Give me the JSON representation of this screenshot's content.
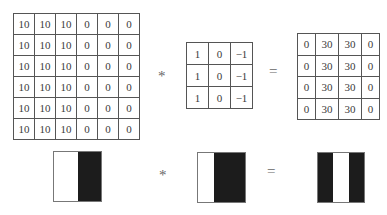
{
  "top_row": {
    "input_matrix": [
      [
        "10",
        "10",
        "10",
        "0",
        "0",
        "0"
      ],
      [
        "10",
        "10",
        "10",
        "0",
        "0",
        "0"
      ],
      [
        "10",
        "10",
        "10",
        "0",
        "0",
        "0"
      ],
      [
        "10",
        "10",
        "10",
        "0",
        "0",
        "0"
      ],
      [
        "10",
        "10",
        "10",
        "0",
        "0",
        "0"
      ],
      [
        "10",
        "10",
        "10",
        "0",
        "0",
        "0"
      ]
    ],
    "convolution_operator": "*",
    "kernel_matrix": [
      [
        "1",
        "0",
        "−1"
      ],
      [
        "1",
        "0",
        "−1"
      ],
      [
        "1",
        "0",
        "−1"
      ]
    ],
    "equals_operator": "=",
    "output_matrix": [
      [
        "0",
        "30",
        "30",
        "0"
      ],
      [
        "0",
        "30",
        "30",
        "0"
      ],
      [
        "0",
        "30",
        "30",
        "0"
      ],
      [
        "0",
        "30",
        "30",
        "0"
      ]
    ]
  },
  "bottom_row": {
    "input_image": {
      "bands": [
        "white",
        "black"
      ]
    },
    "convolution_operator": "*",
    "kernel_image": {
      "bands": [
        "white",
        "black",
        "black"
      ]
    },
    "equals_operator": "=",
    "output_image": {
      "bands": [
        "black",
        "white",
        "black"
      ]
    }
  },
  "colors": {
    "white": "#ffffff",
    "black": "#1c1c1c",
    "border": "#555555"
  }
}
